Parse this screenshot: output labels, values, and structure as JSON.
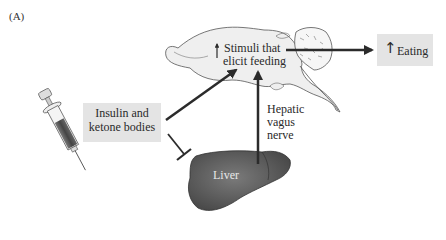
{
  "figure": {
    "panel_label": "(A)",
    "nodes": {
      "injection": {
        "line1": "Insulin and",
        "line2": "ketone bodies",
        "icon": "syringe-icon"
      },
      "brain": {
        "arrow": "↑",
        "line1": "Stimuli that",
        "line2": "elicit feeding",
        "icon": "brain-icon"
      },
      "outcome": {
        "arrow": "↑",
        "label": "Eating"
      },
      "liver": {
        "label": "Liver",
        "icon": "liver-icon"
      },
      "nerve": {
        "line1": "Hepatic",
        "line2": "vagus",
        "line3": "nerve"
      }
    },
    "edges": [
      {
        "from": "injection",
        "to": "brain",
        "type": "activate"
      },
      {
        "from": "injection",
        "to": "liver",
        "type": "inhibit"
      },
      {
        "from": "liver",
        "to": "brain",
        "type": "activate",
        "label": "Hepatic vagus nerve"
      },
      {
        "from": "brain",
        "to": "outcome",
        "type": "activate"
      }
    ],
    "colors": {
      "box_fill": "#e4e4e4",
      "brain_fill": "#efefef",
      "liver_fill": "#555555",
      "arrow": "#2b2b2b"
    }
  }
}
